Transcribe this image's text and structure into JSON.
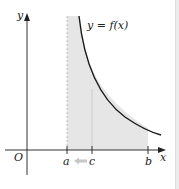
{
  "figure": {
    "type": "improper-integral-diagram",
    "curve_label": "y = f(x)",
    "axes": {
      "x_label": "x",
      "y_label": "y",
      "origin_label": "O"
    },
    "points": [
      {
        "name": "a",
        "label": "a"
      },
      {
        "name": "c",
        "label": "c"
      },
      {
        "name": "b",
        "label": "b"
      }
    ],
    "annotations": {
      "arrow_direction": "c toward a",
      "asymptote": "vertical dashed line at x = a",
      "shaded_region": "area under y = f(x) from a to b"
    },
    "colors": {
      "shade": "#e6e6e6",
      "curve": "#1a1a1a",
      "axis": "#333333",
      "asymptote": "#bdbdbd",
      "arrow": "#c8c8c8"
    }
  }
}
